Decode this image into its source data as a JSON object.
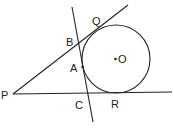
{
  "diagram": {
    "labels": {
      "P": "P",
      "Q": "Q",
      "B": "B",
      "A": "A",
      "O": "O",
      "C": "C",
      "R": "R"
    },
    "color": "#222222"
  }
}
